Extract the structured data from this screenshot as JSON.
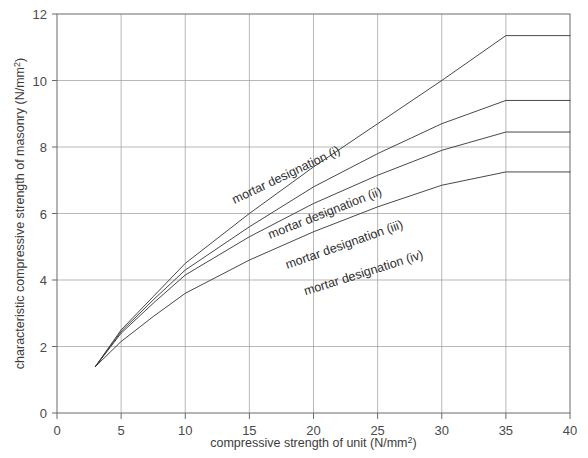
{
  "chart_data": {
    "type": "line",
    "title": "",
    "xlabel": "compressive strength of unit (N/mm2)",
    "ylabel": "characteristic compressive strength of masonry (N/mm2)",
    "xlabel_base": "compressive strength of unit (N/mm",
    "xlabel_sup": "2",
    "xlabel_tail": ")",
    "ylabel_base": "characteristic compressive strength of masonry (N/mm",
    "ylabel_sup": "2",
    "ylabel_tail": ")",
    "xlim": [
      0,
      40
    ],
    "ylim": [
      0,
      12
    ],
    "xticks": [
      0,
      5,
      10,
      15,
      20,
      25,
      30,
      35,
      40
    ],
    "yticks": [
      0,
      2,
      4,
      6,
      8,
      10,
      12
    ],
    "xtick_labels": [
      "0",
      "5",
      "10",
      "15",
      "20",
      "25",
      "30",
      "35",
      "40"
    ],
    "ytick_labels": [
      "0",
      "2",
      "4",
      "6",
      "8",
      "10",
      "12"
    ],
    "grid": true,
    "legend": "inline-curve-labels",
    "line_color": "#333333",
    "grid_color": "#9a9a9a",
    "axis_color": "#6a6a6a",
    "series": [
      {
        "name": "mortar designation (i)",
        "label": "mortar designation (i)",
        "label_x": 18.0,
        "label_y": 7.05,
        "label_rotation": -25.5,
        "x": [
          3,
          5,
          7.5,
          10,
          15,
          20,
          25,
          30,
          35,
          40
        ],
        "values": [
          1.4,
          2.5,
          3.5,
          4.5,
          6.0,
          7.4,
          8.7,
          10.0,
          11.35,
          11.35
        ]
      },
      {
        "name": "mortar designation (ii)",
        "label": "mortar designation (ii)",
        "label_x": 21.0,
        "label_y": 5.9,
        "label_rotation": -21.5,
        "x": [
          3,
          5,
          7.5,
          10,
          15,
          20,
          25,
          30,
          35,
          40
        ],
        "values": [
          1.4,
          2.45,
          3.4,
          4.3,
          5.6,
          6.8,
          7.8,
          8.7,
          9.4,
          9.4
        ]
      },
      {
        "name": "mortar designation (iii)",
        "label": "mortar designation (iii)",
        "label_x": 22.5,
        "label_y": 4.95,
        "label_rotation": -19.5,
        "x": [
          3,
          5,
          7.5,
          10,
          15,
          20,
          25,
          30,
          35,
          40
        ],
        "values": [
          1.4,
          2.4,
          3.3,
          4.15,
          5.3,
          6.3,
          7.15,
          7.9,
          8.45,
          8.45
        ]
      },
      {
        "name": "mortar designation (iv)",
        "label": "mortar designation (iv)",
        "label_x": 24.0,
        "label_y": 4.1,
        "label_rotation": -17.5,
        "x": [
          3,
          5,
          7.5,
          10,
          15,
          20,
          25,
          30,
          35,
          40
        ],
        "values": [
          1.4,
          2.15,
          2.9,
          3.6,
          4.6,
          5.45,
          6.2,
          6.85,
          7.25,
          7.25
        ]
      }
    ]
  }
}
